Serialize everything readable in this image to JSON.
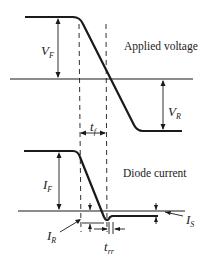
{
  "captions": {
    "applied_voltage": "Applied voltage",
    "diode_current": "Diode current"
  },
  "labels": {
    "vf": {
      "main": "V",
      "sub": "F"
    },
    "vr": {
      "main": "V",
      "sub": "R"
    },
    "tf": {
      "main": "t",
      "sub": "f"
    },
    "if": {
      "main": "I",
      "sub": "F"
    },
    "ir": {
      "main": "I",
      "sub": "R"
    },
    "is": {
      "main": "I",
      "sub": "S"
    },
    "trr": {
      "main": "t",
      "sub": "rr"
    }
  },
  "colors": {
    "line": "#1a1a1a",
    "background": "#ffffff"
  }
}
